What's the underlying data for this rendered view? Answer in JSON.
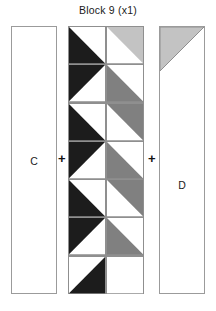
{
  "title": "Block 9 (x1)",
  "colors": {
    "black": "#1c1c1c",
    "light_gray": "#c3c3c3",
    "mid_gray": "#808080",
    "white": "#ffffff",
    "outline": "#8f8f8f",
    "text": "#1a1a1a"
  },
  "operators": {
    "plus_1": "+",
    "plus_2": "+"
  },
  "units": [
    {
      "id": "unit-c",
      "label": "C",
      "kind": "plain-rectangle",
      "fill": "white",
      "width": 46,
      "height": 268
    },
    {
      "id": "unit-center",
      "label": "",
      "kind": "pieced-column",
      "columns": 2,
      "rows": 7,
      "width": 76,
      "height": 268
    },
    {
      "id": "unit-d",
      "label": "D",
      "kind": "rectangle-with-top-triangle",
      "fill": "white",
      "top_triangle_fill": "light_gray",
      "top_triangle_corner": "upper-left",
      "width": 46,
      "height": 268
    }
  ],
  "center_grid": [
    [
      {
        "name": "hst-r1c1",
        "fill": "black",
        "corner": "lower-left"
      },
      {
        "name": "hst-r1c2",
        "fill": "light_gray",
        "corner": "upper-right"
      }
    ],
    [
      {
        "name": "hst-r2c1",
        "fill": "black",
        "corner": "upper-left"
      },
      {
        "name": "hst-r2c2",
        "fill": "mid_gray",
        "corner": "lower-left"
      }
    ],
    [
      {
        "name": "hst-r3c1",
        "fill": "black",
        "corner": "lower-left"
      },
      {
        "name": "hst-r3c2",
        "fill": "mid_gray",
        "corner": "upper-right"
      }
    ],
    [
      {
        "name": "hst-r4c1",
        "fill": "black",
        "corner": "upper-left"
      },
      {
        "name": "hst-r4c2",
        "fill": "mid_gray",
        "corner": "lower-left"
      }
    ],
    [
      {
        "name": "hst-r5c1",
        "fill": "black",
        "corner": "lower-left"
      },
      {
        "name": "hst-r5c2",
        "fill": "mid_gray",
        "corner": "upper-right"
      }
    ],
    [
      {
        "name": "hst-r6c1",
        "fill": "black",
        "corner": "upper-left"
      },
      {
        "name": "hst-r6c2",
        "fill": "mid_gray",
        "corner": "lower-left"
      }
    ],
    [
      {
        "name": "hst-r7c1",
        "fill": "black",
        "corner": "lower-right"
      },
      {
        "name": "hst-r7c2",
        "fill": "white",
        "corner": "none"
      }
    ]
  ]
}
